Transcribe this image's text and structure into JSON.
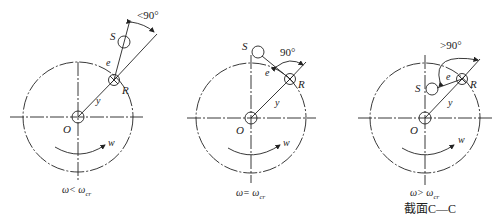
{
  "panels": [
    {
      "id": "below-critical",
      "labels": {
        "S": "S",
        "e": "e",
        "R": "R",
        "y": "y",
        "O": "O",
        "w": "w"
      },
      "angle_label": "<90°",
      "caption": "ω< ω",
      "caption_sub": "cr"
    },
    {
      "id": "at-critical",
      "labels": {
        "S": "S",
        "e": "e",
        "R": "R",
        "y": "y",
        "O": "O",
        "w": "w"
      },
      "angle_label": "90°",
      "caption": "ω= ω",
      "caption_sub": "cr"
    },
    {
      "id": "above-critical",
      "labels": {
        "S": "S",
        "e": "e",
        "R": "R",
        "y": "y",
        "O": "O",
        "w": "w"
      },
      "angle_label": ">90°",
      "caption": "ω> ω",
      "caption_sub": "cr",
      "section_label": "截面C—C"
    }
  ],
  "colors": {
    "ink": "#222222",
    "background": "#ffffff"
  }
}
